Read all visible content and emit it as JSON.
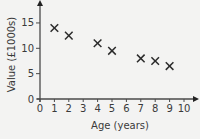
{
  "chart_data": {
    "type": "scatter",
    "title": "",
    "xlabel": "Age (years)",
    "ylabel": "Value (£1000s)",
    "xlim": [
      0,
      10
    ],
    "ylim": [
      0,
      17
    ],
    "x_ticks": [
      0,
      1,
      2,
      3,
      4,
      5,
      6,
      7,
      8,
      9,
      10
    ],
    "y_ticks": [
      0,
      5,
      10,
      15
    ],
    "grid": false,
    "legend": null,
    "marker": "x",
    "points": [
      {
        "x": 1,
        "y": 14
      },
      {
        "x": 2,
        "y": 12.5
      },
      {
        "x": 4,
        "y": 11
      },
      {
        "x": 5,
        "y": 9.5
      },
      {
        "x": 7,
        "y": 8
      },
      {
        "x": 8,
        "y": 7.5
      },
      {
        "x": 9,
        "y": 6.5
      }
    ],
    "colors": {
      "marker": "#2b2b2b",
      "axis": "#4a4a4a",
      "background": "#f3f3f2"
    }
  }
}
